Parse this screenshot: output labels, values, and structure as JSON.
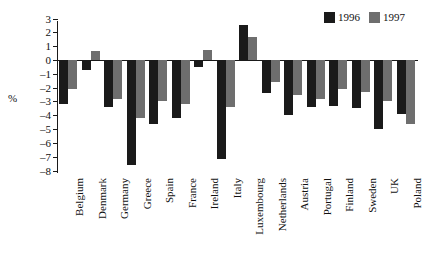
{
  "chart_data": {
    "type": "bar",
    "title": "",
    "xlabel": "",
    "ylabel": "%",
    "ylim": [
      -8,
      3
    ],
    "yticks": [
      3,
      2,
      1,
      0,
      -1,
      -2,
      -3,
      -4,
      -5,
      -6,
      -7,
      -8
    ],
    "ytick_labels": [
      "3",
      "2",
      "1",
      "0",
      "–1",
      "–2",
      "–3",
      "–4",
      "–5",
      "–6",
      "–7",
      "–8"
    ],
    "grid": false,
    "legend_position": "top-right",
    "categories": [
      "Belgium",
      "Denmark",
      "Germany",
      "Greece",
      "Spain",
      "France",
      "Ireland",
      "Italy",
      "Luxembourg",
      "Netherlands",
      "Austria",
      "Portugal",
      "Finland",
      "Sweden",
      "UK",
      "Poland"
    ],
    "series": [
      {
        "name": "1996",
        "color": "#1a1a1a",
        "values": [
          -3.2,
          -0.7,
          -3.4,
          -7.6,
          -4.6,
          -4.2,
          -0.5,
          -7.2,
          2.5,
          -2.4,
          -4.0,
          -3.4,
          -3.3,
          -3.5,
          -5.0,
          -3.9
        ]
      },
      {
        "name": "1997",
        "color": "#6e6e6e",
        "values": [
          -2.1,
          0.65,
          -2.8,
          -4.2,
          -3.0,
          -3.2,
          0.7,
          -3.4,
          1.7,
          -1.6,
          -2.5,
          -2.8,
          -2.1,
          -2.3,
          -3.0,
          -4.6
        ]
      }
    ]
  }
}
